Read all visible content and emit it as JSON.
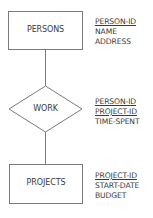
{
  "diagram": {
    "type": "entity-relationship",
    "line_color": "#7a7a7a",
    "entities": [
      {
        "name": "PERSONS",
        "attributes": [
          {
            "name": "PERSON-ID",
            "key": true
          },
          {
            "name": "NAME",
            "key": false
          },
          {
            "name": "ADDRESS",
            "key": false
          }
        ]
      },
      {
        "name": "PROJECTS",
        "attributes": [
          {
            "name": "PROJECT-ID",
            "key": true
          },
          {
            "name": "START-DATE",
            "key": false
          },
          {
            "name": "BUDGET",
            "key": false
          }
        ]
      }
    ],
    "relationships": [
      {
        "name": "WORK",
        "connects": [
          "PERSONS",
          "PROJECTS"
        ],
        "attributes": [
          {
            "name": "PERSON-ID",
            "key": true
          },
          {
            "name": "PROJECT-ID",
            "key": true
          },
          {
            "name": "TIME-SPENT",
            "key": false
          }
        ]
      }
    ]
  }
}
